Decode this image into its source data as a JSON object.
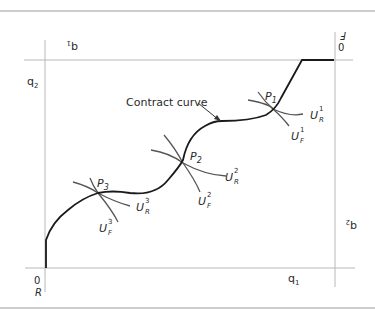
{
  "diagram": {
    "type": "edgeworth-box",
    "origin_R": {
      "zero": "0",
      "name": "R"
    },
    "origin_F": {
      "zero": "0",
      "name": "F"
    },
    "axes": {
      "q1_bottom": {
        "base": "q",
        "sub": "1"
      },
      "q2_left": {
        "base": "q",
        "sub": "2"
      },
      "q1_top_rotated": {
        "base": "q",
        "sub": "1"
      },
      "q2_right_rotated": {
        "base": "q",
        "sub": "2"
      }
    },
    "curve_label": "Contract curve",
    "points": [
      {
        "name": "P",
        "sub": "1"
      },
      {
        "name": "P",
        "sub": "2"
      },
      {
        "name": "P",
        "sub": "3"
      }
    ],
    "indifference_labels": {
      "UR1": {
        "base": "U",
        "sup": "1",
        "sub": "R"
      },
      "UF1": {
        "base": "U",
        "sup": "1",
        "sub": "F"
      },
      "UR2": {
        "base": "U",
        "sup": "2",
        "sub": "R"
      },
      "UF2": {
        "base": "U",
        "sup": "2",
        "sub": "F"
      },
      "UR3": {
        "base": "U",
        "sup": "3",
        "sub": "R"
      },
      "UF3": {
        "base": "U",
        "sup": "3",
        "sub": "F"
      }
    },
    "colors": {
      "axis": "#b8b8b8",
      "curve": "#1a1a1a",
      "indiff": "#555555",
      "rule": "#9a9a9a"
    }
  }
}
